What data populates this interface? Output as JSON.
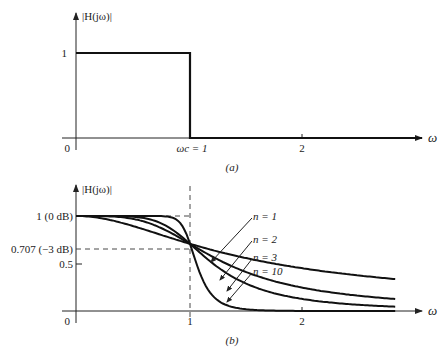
{
  "chart_data": [
    {
      "type": "line",
      "title": "Ideal low-pass filter magnitude response",
      "caption": "(a)",
      "ylabel": "|H(jω)|",
      "xlabel": "ω",
      "xticks": [
        {
          "value": 0,
          "label": "0"
        },
        {
          "value": 1,
          "label": "ωc = 1"
        },
        {
          "value": 2,
          "label": "2"
        }
      ],
      "yticks": [
        {
          "value": 1,
          "label": "1"
        }
      ],
      "xlim": [
        0,
        3
      ],
      "ylim": [
        0,
        1.15
      ],
      "series": [
        {
          "name": "ideal",
          "x": [
            0,
            1,
            1,
            3
          ],
          "y": [
            1,
            1,
            0,
            0
          ]
        }
      ]
    },
    {
      "type": "line",
      "title": "Butterworth low-pass filter magnitude responses",
      "caption": "(b)",
      "ylabel": "|H(jω)|",
      "xlabel": "ω",
      "xticks": [
        {
          "value": 0,
          "label": "0"
        },
        {
          "value": 1,
          "label": "1"
        },
        {
          "value": 2,
          "label": "2"
        }
      ],
      "yticks": [
        {
          "value": 1,
          "label": "1 (0 dB)"
        },
        {
          "value": 0.707,
          "label": "0.707 (−3 dB)"
        },
        {
          "value": 0.5,
          "label": "0.5"
        }
      ],
      "xlim": [
        0,
        3
      ],
      "ylim": [
        0,
        1.15
      ],
      "reference_lines": [
        {
          "type": "horizontal",
          "y": 1,
          "style": "dashed"
        },
        {
          "type": "horizontal",
          "y": 0.707,
          "style": "dashed"
        },
        {
          "type": "vertical",
          "x": 1,
          "style": "dashed"
        }
      ],
      "series": [
        {
          "name": "n = 1",
          "order": 1
        },
        {
          "name": "n = 2",
          "order": 2
        },
        {
          "name": "n = 3",
          "order": 3
        },
        {
          "name": "n = 10",
          "order": 10
        }
      ],
      "legend_labels": [
        "n = 1",
        "n = 2",
        "n = 3",
        "n = 10"
      ]
    }
  ],
  "labels": {
    "a": {
      "ylabel": "|H(jω)|",
      "y1": "1",
      "x0": "0",
      "xc": "ωc = 1",
      "x2": "2",
      "omega": "ω",
      "caption": "(a)"
    },
    "b": {
      "ylabel": "|H(jω)|",
      "y1": "1 (0 dB)",
      "y707": "0.707 (−3 dB)",
      "y05": "0.5",
      "x0": "0",
      "x1": "1",
      "x2": "2",
      "omega": "ω",
      "caption": "(b)",
      "n1": "n = 1",
      "n2": "n = 2",
      "n3": "n = 3",
      "n10": "n = 10"
    }
  }
}
